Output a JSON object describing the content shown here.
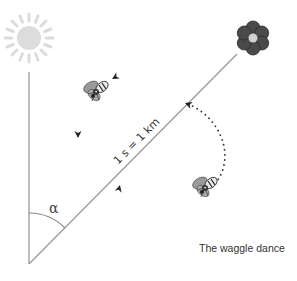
{
  "figure": {
    "caption": "The waggle dance",
    "distance_label": "1 s = 1 km",
    "angle_label": "α",
    "elements": {
      "sun": {
        "icon": "sun-icon",
        "color": "#dcdcdc"
      },
      "flower": {
        "icon": "flower-icon",
        "petal_color": "#4a4a4a",
        "center_color": "#d0d0d0"
      },
      "bees": [
        {
          "icon": "bee-icon",
          "position": "upper-left, flying toward line"
        },
        {
          "icon": "bee-icon",
          "position": "lower-right, end of dotted return path"
        }
      ],
      "lines": {
        "vertical_reference": "gravity / sun direction",
        "waggle_run": "direction to flower",
        "return_path": "dotted arc"
      }
    },
    "colors": {
      "line": "#9a9a9a",
      "arrow": "#222222",
      "text": "#333333"
    }
  }
}
